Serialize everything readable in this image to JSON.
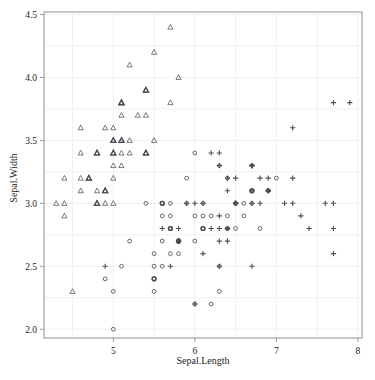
{
  "chart_data": {
    "type": "scatter",
    "title": "",
    "xlabel": "Sepal.Length",
    "ylabel": "Sepal.Width",
    "xlim": [
      4.15,
      8.05
    ],
    "ylim": [
      1.93,
      4.52
    ],
    "xticks": [
      5,
      6,
      7,
      8
    ],
    "xtick_labels": [
      "5",
      "6",
      "7",
      "8"
    ],
    "yticks": [
      2.0,
      2.5,
      3.0,
      3.5,
      4.0,
      4.5
    ],
    "ytick_labels": [
      "2.0",
      "2.5",
      "3.0",
      "3.5",
      "4.0",
      "4.5"
    ],
    "grid": true,
    "grid_x_minor": [
      4.5,
      5.0,
      5.5,
      6.0,
      6.5,
      7.0,
      7.5,
      8.0
    ],
    "grid_y_minor": [
      2.0,
      2.25,
      2.5,
      2.75,
      3.0,
      3.25,
      3.5,
      3.75,
      4.0,
      4.25,
      4.5
    ],
    "legend": "none",
    "marker_color": "#4d4d58",
    "grid_color": "#f0f0f2",
    "frame_color": "#9a9a9a",
    "background": "#ffffff",
    "series": [
      {
        "name": "setosa",
        "marker": "triangle",
        "points": [
          [
            5.1,
            3.5
          ],
          [
            4.9,
            3.0
          ],
          [
            4.7,
            3.2
          ],
          [
            4.6,
            3.1
          ],
          [
            5.0,
            3.6
          ],
          [
            5.4,
            3.9
          ],
          [
            4.6,
            3.4
          ],
          [
            5.0,
            3.4
          ],
          [
            4.4,
            2.9
          ],
          [
            4.9,
            3.1
          ],
          [
            5.4,
            3.7
          ],
          [
            4.8,
            3.4
          ],
          [
            4.8,
            3.0
          ],
          [
            4.3,
            3.0
          ],
          [
            5.8,
            4.0
          ],
          [
            5.7,
            4.4
          ],
          [
            5.4,
            3.9
          ],
          [
            5.1,
            3.5
          ],
          [
            5.7,
            3.8
          ],
          [
            5.1,
            3.8
          ],
          [
            5.4,
            3.4
          ],
          [
            5.1,
            3.7
          ],
          [
            4.6,
            3.6
          ],
          [
            5.1,
            3.3
          ],
          [
            4.8,
            3.4
          ],
          [
            5.0,
            3.0
          ],
          [
            5.0,
            3.4
          ],
          [
            5.2,
            3.5
          ],
          [
            5.2,
            3.4
          ],
          [
            4.7,
            3.2
          ],
          [
            4.8,
            3.1
          ],
          [
            5.4,
            3.4
          ],
          [
            5.2,
            4.1
          ],
          [
            5.5,
            4.2
          ],
          [
            4.9,
            3.1
          ],
          [
            5.0,
            3.2
          ],
          [
            5.5,
            3.5
          ],
          [
            4.9,
            3.6
          ],
          [
            4.4,
            3.0
          ],
          [
            5.1,
            3.4
          ],
          [
            5.0,
            3.5
          ],
          [
            4.5,
            2.3
          ],
          [
            4.4,
            3.2
          ],
          [
            5.0,
            3.5
          ],
          [
            5.1,
            3.8
          ],
          [
            4.8,
            3.0
          ],
          [
            5.1,
            3.8
          ],
          [
            4.6,
            3.2
          ],
          [
            5.3,
            3.7
          ],
          [
            5.0,
            3.3
          ]
        ]
      },
      {
        "name": "versicolor",
        "marker": "circle",
        "points": [
          [
            7.0,
            3.2
          ],
          [
            6.4,
            3.2
          ],
          [
            6.9,
            3.1
          ],
          [
            5.5,
            2.3
          ],
          [
            6.5,
            2.8
          ],
          [
            5.7,
            2.8
          ],
          [
            6.3,
            3.3
          ],
          [
            4.9,
            2.4
          ],
          [
            6.6,
            2.9
          ],
          [
            5.2,
            2.7
          ],
          [
            5.0,
            2.0
          ],
          [
            5.9,
            3.0
          ],
          [
            6.0,
            2.2
          ],
          [
            6.1,
            2.9
          ],
          [
            5.6,
            2.9
          ],
          [
            6.7,
            3.1
          ],
          [
            5.6,
            3.0
          ],
          [
            5.8,
            2.7
          ],
          [
            6.2,
            2.2
          ],
          [
            5.6,
            2.5
          ],
          [
            5.9,
            3.2
          ],
          [
            6.1,
            2.8
          ],
          [
            6.3,
            2.5
          ],
          [
            6.1,
            2.8
          ],
          [
            6.4,
            2.9
          ],
          [
            6.6,
            3.0
          ],
          [
            6.8,
            2.8
          ],
          [
            6.7,
            3.0
          ],
          [
            6.0,
            2.9
          ],
          [
            5.7,
            2.6
          ],
          [
            5.5,
            2.4
          ],
          [
            5.5,
            2.4
          ],
          [
            5.8,
            2.7
          ],
          [
            6.0,
            2.7
          ],
          [
            5.4,
            3.0
          ],
          [
            6.0,
            3.4
          ],
          [
            6.7,
            3.1
          ],
          [
            6.3,
            2.3
          ],
          [
            5.6,
            3.0
          ],
          [
            5.5,
            2.5
          ],
          [
            5.5,
            2.6
          ],
          [
            6.1,
            3.0
          ],
          [
            5.8,
            2.6
          ],
          [
            5.0,
            2.3
          ],
          [
            5.6,
            2.7
          ],
          [
            5.7,
            3.0
          ],
          [
            5.7,
            2.9
          ],
          [
            6.2,
            2.9
          ],
          [
            5.1,
            2.5
          ],
          [
            5.7,
            2.8
          ]
        ]
      },
      {
        "name": "virginica",
        "marker": "plus",
        "points": [
          [
            6.3,
            3.3
          ],
          [
            5.8,
            2.7
          ],
          [
            7.1,
            3.0
          ],
          [
            6.3,
            2.9
          ],
          [
            6.5,
            3.0
          ],
          [
            7.6,
            3.0
          ],
          [
            4.9,
            2.5
          ],
          [
            7.3,
            2.9
          ],
          [
            6.7,
            2.5
          ],
          [
            7.2,
            3.6
          ],
          [
            6.5,
            3.2
          ],
          [
            6.4,
            2.7
          ],
          [
            6.8,
            3.0
          ],
          [
            5.7,
            2.5
          ],
          [
            5.8,
            2.8
          ],
          [
            6.4,
            3.2
          ],
          [
            6.5,
            3.0
          ],
          [
            7.7,
            3.8
          ],
          [
            7.7,
            2.6
          ],
          [
            6.0,
            2.2
          ],
          [
            6.9,
            3.2
          ],
          [
            5.6,
            2.8
          ],
          [
            7.7,
            2.8
          ],
          [
            6.3,
            2.7
          ],
          [
            6.7,
            3.3
          ],
          [
            7.2,
            3.2
          ],
          [
            6.2,
            2.8
          ],
          [
            6.1,
            3.0
          ],
          [
            6.4,
            2.8
          ],
          [
            7.2,
            3.0
          ],
          [
            7.4,
            2.8
          ],
          [
            7.9,
            3.8
          ],
          [
            6.4,
            2.8
          ],
          [
            6.3,
            2.8
          ],
          [
            6.1,
            2.6
          ],
          [
            7.7,
            3.0
          ],
          [
            6.3,
            3.4
          ],
          [
            6.4,
            3.1
          ],
          [
            6.0,
            3.0
          ],
          [
            6.9,
            3.1
          ],
          [
            6.7,
            3.1
          ],
          [
            6.9,
            3.1
          ],
          [
            5.8,
            2.7
          ],
          [
            6.8,
            3.2
          ],
          [
            6.7,
            3.3
          ],
          [
            6.7,
            3.0
          ],
          [
            6.3,
            2.5
          ],
          [
            6.5,
            3.0
          ],
          [
            6.2,
            3.4
          ],
          [
            5.9,
            3.0
          ]
        ]
      }
    ]
  }
}
